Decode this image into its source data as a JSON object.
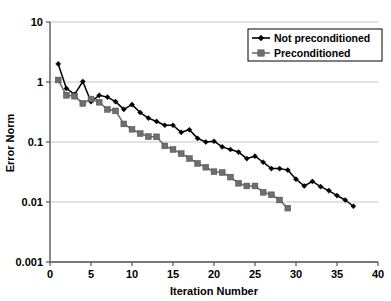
{
  "chart_data": {
    "type": "line",
    "title": "",
    "xlabel": "Iteration Number",
    "ylabel": "Error Norm",
    "xlim": [
      0,
      40
    ],
    "ylim": [
      0.001,
      10
    ],
    "yscale": "log",
    "xticks": [
      0,
      5,
      10,
      15,
      20,
      25,
      30,
      35,
      40
    ],
    "xtick_labels": [
      "0",
      "5",
      "10",
      "15",
      "20",
      "25",
      "30",
      "35",
      "40"
    ],
    "yticks": [
      0.001,
      0.01,
      0.1,
      1,
      10
    ],
    "ytick_labels": [
      "0.001",
      "0.01",
      "0.1",
      "1",
      "10"
    ],
    "grid": "horizontal",
    "legend_position": "top-right",
    "series": [
      {
        "name": "Not preconditioned",
        "color": "#000000",
        "marker": "diamond",
        "x": [
          1,
          2,
          3,
          4,
          5,
          6,
          7,
          8,
          9,
          10,
          11,
          12,
          13,
          14,
          15,
          16,
          17,
          18,
          19,
          20,
          21,
          22,
          23,
          24,
          25,
          26,
          27,
          28,
          29,
          30,
          31,
          32,
          33,
          34,
          35,
          36,
          37
        ],
        "y": [
          2.0,
          0.78,
          0.62,
          1.02,
          0.47,
          0.6,
          0.56,
          0.47,
          0.35,
          0.42,
          0.31,
          0.25,
          0.22,
          0.19,
          0.19,
          0.145,
          0.16,
          0.115,
          0.1,
          0.103,
          0.083,
          0.075,
          0.068,
          0.053,
          0.058,
          0.046,
          0.036,
          0.036,
          0.034,
          0.024,
          0.0185,
          0.022,
          0.018,
          0.0155,
          0.0128,
          0.0108,
          0.0085
        ]
      },
      {
        "name": "Preconditioned",
        "color": "#6e6e6e",
        "marker": "square",
        "x": [
          1,
          2,
          3,
          4,
          5,
          6,
          7,
          8,
          9,
          10,
          11,
          12,
          13,
          14,
          15,
          16,
          17,
          18,
          19,
          20,
          21,
          22,
          23,
          24,
          25,
          26,
          27,
          28,
          29
        ],
        "y": [
          1.08,
          0.6,
          0.58,
          0.44,
          0.52,
          0.46,
          0.35,
          0.33,
          0.2,
          0.163,
          0.138,
          0.123,
          0.122,
          0.086,
          0.075,
          0.064,
          0.053,
          0.044,
          0.038,
          0.032,
          0.031,
          0.026,
          0.0205,
          0.0185,
          0.0185,
          0.0145,
          0.0132,
          0.0108,
          0.0079
        ]
      }
    ]
  },
  "legend": {
    "items": [
      {
        "label": "Not preconditioned"
      },
      {
        "label": "Preconditioned"
      }
    ]
  }
}
